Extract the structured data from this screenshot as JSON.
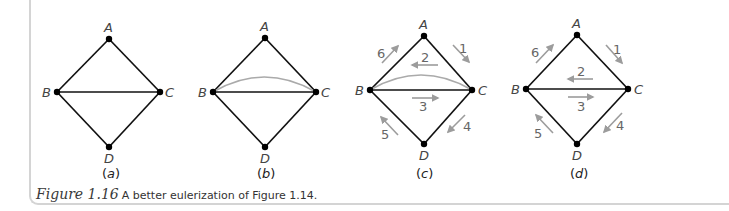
{
  "figure": {
    "number": "Figure 1.16",
    "caption": "A better eulerization of Figure 1.14."
  },
  "graphs": [
    {
      "id": "a",
      "sublabel": "a",
      "vertices": [
        {
          "name": "A",
          "x": 109,
          "y": 39
        },
        {
          "name": "B",
          "x": 57,
          "y": 92
        },
        {
          "name": "C",
          "x": 160,
          "y": 92
        },
        {
          "name": "D",
          "x": 109,
          "y": 147
        }
      ],
      "edges": [
        "A-B",
        "A-C",
        "B-C",
        "B-D",
        "C-D"
      ],
      "duplicated_edges": [],
      "arrows": []
    },
    {
      "id": "b",
      "sublabel": "b",
      "vertices": [
        {
          "name": "A",
          "x": 265,
          "y": 38
        },
        {
          "name": "B",
          "x": 213,
          "y": 92
        },
        {
          "name": "C",
          "x": 316,
          "y": 92
        },
        {
          "name": "D",
          "x": 265,
          "y": 147
        }
      ],
      "edges": [
        "A-B",
        "A-C",
        "B-C",
        "B-D",
        "C-D"
      ],
      "duplicated_edges": [
        "B-C"
      ],
      "arrows": []
    },
    {
      "id": "c",
      "sublabel": "c",
      "vertices": [
        {
          "name": "A",
          "x": 424,
          "y": 36
        },
        {
          "name": "B",
          "x": 370,
          "y": 90
        },
        {
          "name": "C",
          "x": 472,
          "y": 90
        },
        {
          "name": "D",
          "x": 424,
          "y": 144
        }
      ],
      "edges": [
        "A-B",
        "A-C",
        "B-C",
        "B-D",
        "C-D"
      ],
      "duplicated_edges": [
        "B-C"
      ],
      "arrows": [
        {
          "label": "1",
          "edge": "A-C"
        },
        {
          "label": "2",
          "edge": "C-B"
        },
        {
          "label": "3",
          "edge": "B-C"
        },
        {
          "label": "4",
          "edge": "C-D"
        },
        {
          "label": "5",
          "edge": "D-B"
        },
        {
          "label": "6",
          "edge": "B-A"
        }
      ]
    },
    {
      "id": "d",
      "sublabel": "d",
      "vertices": [
        {
          "name": "A",
          "x": 577,
          "y": 35
        },
        {
          "name": "B",
          "x": 526,
          "y": 89
        },
        {
          "name": "C",
          "x": 628,
          "y": 89
        },
        {
          "name": "D",
          "x": 577,
          "y": 144
        }
      ],
      "edges": [
        "A-B",
        "A-C",
        "B-C",
        "B-D",
        "C-D"
      ],
      "duplicated_edges": [],
      "arrows": [
        {
          "label": "1",
          "edge": "A-C"
        },
        {
          "label": "2",
          "edge": "C-B"
        },
        {
          "label": "3",
          "edge": "B-C"
        },
        {
          "label": "4",
          "edge": "C-D"
        },
        {
          "label": "5",
          "edge": "D-B"
        },
        {
          "label": "6",
          "edge": "B-A"
        }
      ]
    }
  ],
  "colors": {
    "edge": "#111111",
    "duplicate_edge": "#aaaaaa",
    "arrow": "#9c9c9c",
    "border": "#d4d4d4"
  }
}
